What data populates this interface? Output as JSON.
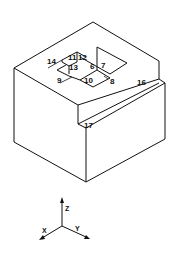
{
  "figure": {
    "labels": {
      "l6": "6",
      "l7": "7",
      "l8": "8",
      "l9": "9",
      "l10": "10",
      "l11": "11",
      "l12": "12",
      "l13": "13",
      "l14": "14",
      "l16": "16",
      "l17": "17"
    },
    "axes": {
      "x": "X",
      "y": "Y",
      "z": "Z"
    },
    "colors": {
      "line": "#111111",
      "background": "#ffffff"
    }
  }
}
